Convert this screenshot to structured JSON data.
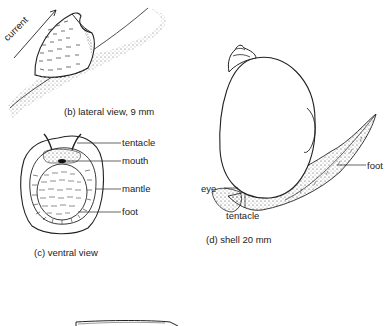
{
  "panel_b": {
    "caption": "(b) lateral view, 9 mm",
    "arrow_label": "current"
  },
  "panel_c": {
    "caption": "(c) ventral view",
    "labels": [
      "tentacle",
      "mouth",
      "mantle",
      "foot"
    ]
  },
  "panel_d": {
    "caption": "(d) shell 20 mm",
    "labels": {
      "foot": "foot",
      "eye": "eye",
      "tentacle": "tentacle"
    }
  }
}
